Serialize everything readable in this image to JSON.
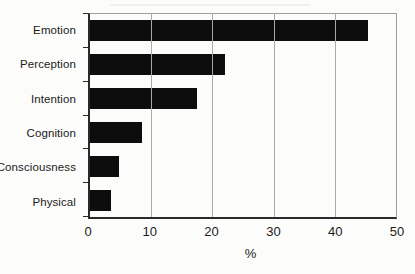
{
  "chart_data": {
    "type": "bar",
    "orientation": "horizontal",
    "title": "",
    "xlabel": "%",
    "ylabel": "",
    "categories": [
      "Emotion",
      "Perception",
      "Intention",
      "Cognition",
      "Consciousness",
      "Physical"
    ],
    "values": [
      45.5,
      22,
      17.5,
      8.5,
      4.8,
      3.4
    ],
    "xlim": [
      0,
      50
    ],
    "xticks": [
      0,
      10,
      20,
      30,
      40,
      50
    ],
    "grid": true,
    "legend": "none",
    "colors": {
      "bar": "#0d0d0d",
      "gridline": "#a9a9a9",
      "frame": "#9e9e9e",
      "axis": "#2a2a2a",
      "text": "#1b1b1b",
      "background": "#fcfcfa"
    }
  }
}
